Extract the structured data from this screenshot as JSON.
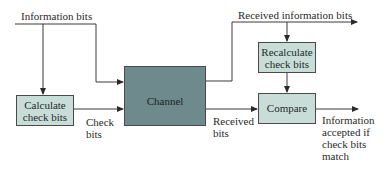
{
  "diagram": {
    "labels": {
      "information_bits": "Information bits",
      "received_information_bits": "Received information bits",
      "check_bits_line1": "Check",
      "check_bits_line2": "bits",
      "received_bits_line1": "Received",
      "received_bits_line2": "bits",
      "output_line1": "Information",
      "output_line2": "accepted if",
      "output_line3": "check bits",
      "output_line4": "match"
    },
    "boxes": {
      "calculate_line1": "Calculate",
      "calculate_line2": "check bits",
      "channel": "Channel",
      "recalculate_line1": "Recalculate",
      "recalculate_line2": "check bits",
      "compare": "Compare"
    },
    "colors": {
      "light_box": "#c9ddd8",
      "dark_box": "#6f8a8c",
      "line": "#3a3a3a"
    }
  }
}
